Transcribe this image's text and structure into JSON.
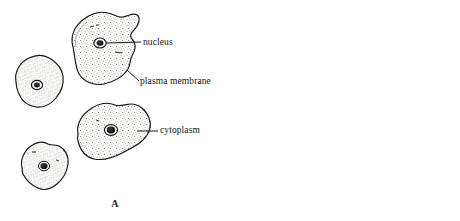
{
  "figure": {
    "kind": "biology-figure-cheek-cells",
    "panels": [
      {
        "id": "A",
        "caption": "A",
        "type": "line-drawing",
        "labels": [
          {
            "name": "nucleus",
            "text": "nucleus"
          },
          {
            "name": "plasma-membrane",
            "text": "plasma membrane"
          },
          {
            "name": "cytoplasm",
            "text": "cytoplasm"
          }
        ],
        "cell_count": 4
      },
      {
        "id": "B",
        "caption": "B",
        "type": "micrograph-photograph",
        "cell_count": 4
      }
    ]
  },
  "colors": {
    "ink": "#141414",
    "paper": "#ffffff",
    "stipple": "#6b6b6b",
    "photo_background": "#e8e7e3",
    "photo_cell": "#6f6f6f"
  },
  "panel_a": {
    "caption": "A",
    "label_nucleus": "nucleus",
    "label_plasma_membrane": "plasma membrane",
    "label_cytoplasm": "cytoplasm"
  },
  "panel_b": {
    "caption": "B"
  }
}
